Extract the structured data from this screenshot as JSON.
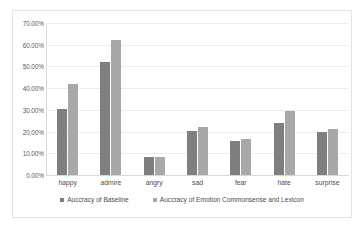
{
  "chart_data": {
    "type": "bar",
    "title": "",
    "subtitle": "",
    "xlabel": "",
    "ylabel": "",
    "ylim": [
      0,
      70
    ],
    "y_ticks": [
      "0.00%",
      "10.00%",
      "20.00%",
      "30.00%",
      "40.00%",
      "50.00%",
      "60.00%",
      "70.00%"
    ],
    "y_tick_values": [
      0,
      10,
      20,
      30,
      40,
      50,
      60,
      70
    ],
    "grid": true,
    "legend_position": "bottom",
    "categories": [
      "happy",
      "admire",
      "angry",
      "sad",
      "fear",
      "hate",
      "surprise"
    ],
    "series": [
      {
        "name": "Auccracy of Baseline",
        "color": "#7f7f7f",
        "values": [
          30.5,
          52.0,
          8.5,
          20.3,
          15.6,
          24.0,
          20.0
        ]
      },
      {
        "name": "Auccracy of Emotion Commonsense and Lexicon",
        "color": "#a8a8a8",
        "values": [
          41.8,
          62.0,
          8.5,
          22.0,
          16.7,
          29.3,
          21.2
        ]
      }
    ],
    "annotations": []
  },
  "legend": {
    "entries": [
      {
        "label": "Auccracy of Baseline",
        "color": "#7f7f7f"
      },
      {
        "label": "Auccracy of Emotion Commonsense and Lexicon",
        "color": "#a8a8a8"
      }
    ]
  }
}
